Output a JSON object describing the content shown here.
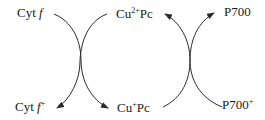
{
  "diagram": {
    "nodes": {
      "cyt_f": {
        "base": "Cyt ",
        "italic": "f",
        "sup": ""
      },
      "cyt_f_plus": {
        "base": "Cyt ",
        "italic": "f",
        "sup": "+"
      },
      "cu2_pc": {
        "base": "Cu",
        "sup": "2+",
        "suffix": "Pc"
      },
      "cu1_pc": {
        "base": "Cu",
        "sup": "+",
        "suffix": "Pc"
      },
      "p700": {
        "base": "P700",
        "sup": ""
      },
      "p700_plus": {
        "base": "P700",
        "sup": "+"
      }
    },
    "edges": [
      {
        "from": "Cyt f",
        "to": "Cyt f+"
      },
      {
        "from": "Cu2+Pc",
        "to": "Cu+Pc"
      },
      {
        "from": "Cu+Pc",
        "to": "Cu2+Pc"
      },
      {
        "from": "P700+",
        "to": "P700"
      }
    ],
    "colors": {
      "stroke": "#2a2a2a",
      "text": "#1a1a1a"
    }
  }
}
